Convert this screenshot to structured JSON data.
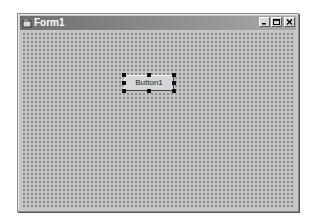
{
  "window": {
    "title": "Form1",
    "controls": [
      {
        "name": "minimize",
        "icon": "minimize-icon"
      },
      {
        "name": "maximize",
        "icon": "maximize-icon"
      },
      {
        "name": "close",
        "icon": "close-icon"
      }
    ]
  },
  "form": {
    "button": {
      "label": "Button1",
      "selected": true
    }
  }
}
